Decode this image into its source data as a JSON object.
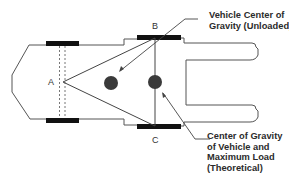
{
  "diagram": {
    "type": "vehicle center of gravity top view",
    "points": {
      "a": "A",
      "b": "B",
      "c": "C"
    },
    "callouts": {
      "unloaded": "Vehicle Center of\nGravity (Unloaded)",
      "loaded": "Center of Gravity\nof Vehicle and\nMaximum Load\n(Theoretical)"
    },
    "colors": {
      "outline": "#555555",
      "wheel": "#111111",
      "cog": "#3a3a3a",
      "text": "#2b2b2b"
    }
  }
}
